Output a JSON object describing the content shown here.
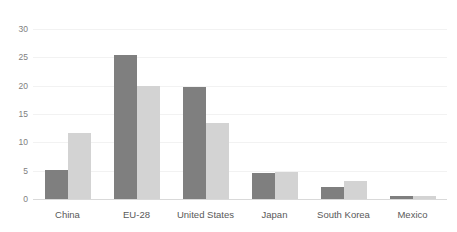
{
  "chart_data": {
    "type": "bar",
    "title": "",
    "subtitle": "",
    "xlabel": "",
    "ylabel": "",
    "categories": [
      "China",
      "EU-28",
      "United States",
      "Japan",
      "South Korea",
      "Mexico"
    ],
    "series": [
      {
        "name": "Series 1",
        "color": "#7f7f7f",
        "values": [
          5.2,
          25.4,
          19.8,
          4.6,
          2.2,
          0.6
        ]
      },
      {
        "name": "Series 2",
        "color": "#d3d3d3",
        "values": [
          11.6,
          20.0,
          13.5,
          4.7,
          3.1,
          0.5
        ]
      }
    ],
    "ylim": [
      0,
      30
    ],
    "ytick_values": [
      0,
      5,
      10,
      15,
      20,
      25,
      30
    ],
    "ytick_labels": [
      "0",
      "5",
      "10",
      "15",
      "20",
      "25",
      "30"
    ],
    "grid": true,
    "grid_axis": "y",
    "legend": false,
    "legend_position": "none",
    "annotations": []
  },
  "style": {
    "background_color": "#ffffff",
    "gridline_color": "#f2f2f2",
    "axis_line_color": "#d9d9d9",
    "ytick_label_color": "#808080",
    "xtick_label_color": "#595959"
  }
}
